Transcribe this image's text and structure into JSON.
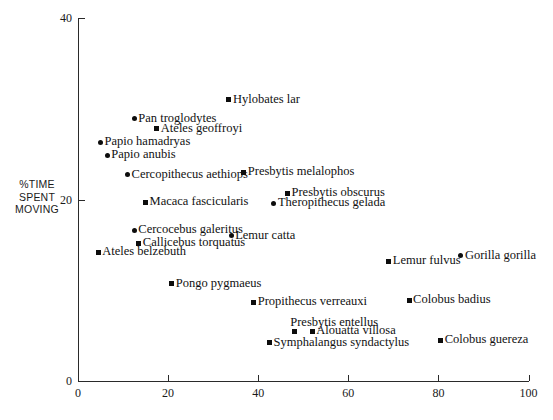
{
  "chart_data": {
    "type": "scatter",
    "title": "",
    "xlabel": "",
    "ylabel": "%TIME SPENT MOVING",
    "ylabel_lines": [
      "%TIME",
      "SPENT",
      "MOVING"
    ],
    "xlim": [
      0,
      100
    ],
    "ylim": [
      0,
      40
    ],
    "xticks": [
      0,
      20,
      40,
      60,
      80,
      100
    ],
    "yticks": [
      0,
      20,
      40
    ],
    "xtick_labels": [
      "0",
      "20",
      "40",
      "60",
      "80",
      "100"
    ],
    "ytick_labels": [
      "0",
      "20",
      "40"
    ],
    "grid": false,
    "legend": "none",
    "points": [
      {
        "label": "Hylobates lar",
        "x": 33.5,
        "y": 31.0,
        "marker": "square",
        "label_side": "right"
      },
      {
        "label": "Pan troglodytes",
        "x": 12.5,
        "y": 28.9,
        "marker": "circle",
        "label_side": "right"
      },
      {
        "label": "Ateles geoffroyi",
        "x": 17.5,
        "y": 27.8,
        "marker": "square",
        "label_side": "right"
      },
      {
        "label": "Papio hamadryas",
        "x": 5.0,
        "y": 26.3,
        "marker": "circle",
        "label_side": "right"
      },
      {
        "label": "Papio anubis",
        "x": 6.5,
        "y": 24.9,
        "marker": "circle",
        "label_side": "right"
      },
      {
        "label": "Cercopithecus aethiops",
        "x": 11.0,
        "y": 22.7,
        "marker": "circle",
        "label_side": "right"
      },
      {
        "label": "Presbytis melalophos",
        "x": 36.8,
        "y": 23.0,
        "marker": "square",
        "label_side": "right"
      },
      {
        "label": "Macaca fascicularis",
        "x": 15.0,
        "y": 19.7,
        "marker": "square",
        "label_side": "right"
      },
      {
        "label": "Presbytis obscurus",
        "x": 46.5,
        "y": 20.7,
        "marker": "square",
        "label_side": "right"
      },
      {
        "label": "Theropithecus gelada",
        "x": 43.5,
        "y": 19.6,
        "marker": "circle",
        "label_side": "right"
      },
      {
        "label": "Cercocebus galeritus",
        "x": 12.5,
        "y": 16.6,
        "marker": "circle",
        "label_side": "right"
      },
      {
        "label": "Callicebus torquatus",
        "x": 13.5,
        "y": 15.2,
        "marker": "square",
        "label_side": "right"
      },
      {
        "label": "Lemur catta",
        "x": 34.0,
        "y": 16.0,
        "marker": "circle",
        "label_side": "right"
      },
      {
        "label": "Ateles belzebuth",
        "x": 4.5,
        "y": 14.2,
        "marker": "square",
        "label_side": "right"
      },
      {
        "label": "Lemur fulvus",
        "x": 69.0,
        "y": 13.2,
        "marker": "square",
        "label_side": "right"
      },
      {
        "label": "Gorilla gorilla",
        "x": 85.0,
        "y": 13.8,
        "marker": "circle",
        "label_side": "right"
      },
      {
        "label": "Pongo pygmaeus",
        "x": 20.8,
        "y": 10.7,
        "marker": "square",
        "label_side": "right"
      },
      {
        "label": "Propithecus verreauxi",
        "x": 39.0,
        "y": 8.7,
        "marker": "square",
        "label_side": "right"
      },
      {
        "label": "Colobus badius",
        "x": 73.5,
        "y": 8.9,
        "marker": "square",
        "label_side": "right"
      },
      {
        "label": "Presbytis entellus",
        "x": 48.0,
        "y": 5.5,
        "marker": "square",
        "label_side": "above"
      },
      {
        "label": "Alouatta villosa",
        "x": 52.0,
        "y": 5.5,
        "marker": "square",
        "label_side": "right"
      },
      {
        "label": "Symphalangus syndactylus",
        "x": 42.5,
        "y": 4.2,
        "marker": "square",
        "label_side": "right"
      },
      {
        "label": "Colobus guereza",
        "x": 80.5,
        "y": 4.5,
        "marker": "square",
        "label_side": "right"
      }
    ]
  }
}
